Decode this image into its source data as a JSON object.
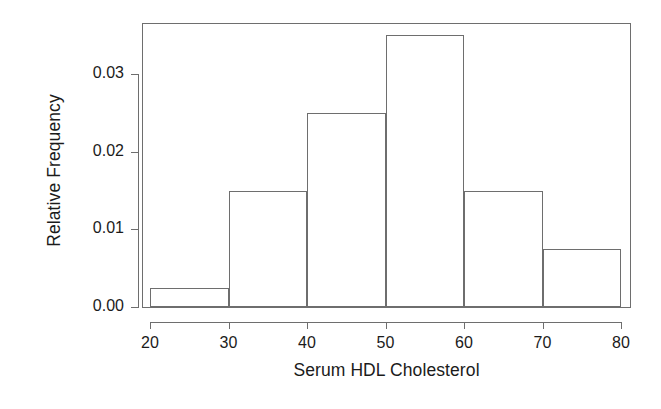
{
  "chart_data": {
    "type": "bar",
    "title": "",
    "subtitle": "",
    "xlabel": "Serum HDL Cholesterol",
    "ylabel": "Relative Frequency",
    "categories": [
      "20-30",
      "30-40",
      "40-50",
      "50-60",
      "60-70",
      "70-80"
    ],
    "bin_edges": [
      20,
      30,
      40,
      50,
      60,
      70,
      80
    ],
    "values": [
      0.0025,
      0.015,
      0.025,
      0.035,
      0.015,
      0.0075
    ],
    "xlim": [
      20,
      80
    ],
    "ylim": [
      0,
      0.0366
    ],
    "xticks": [
      20,
      30,
      40,
      50,
      60,
      70,
      80
    ],
    "xticklabels": [
      "20",
      "30",
      "40",
      "50",
      "60",
      "70",
      "80"
    ],
    "yticks": [
      0.0,
      0.01,
      0.02,
      0.03
    ],
    "yticklabels": [
      "0.00",
      "0.01",
      "0.02",
      "0.03"
    ],
    "grid": false,
    "legend": null,
    "legend_position": "none",
    "bar_fill_color": "#ffffff",
    "bar_edge_color": "#6e6e6e",
    "axis_color": "#6e6e6e",
    "text_color": "#1b1b1b",
    "background_color": "#ffffff"
  }
}
